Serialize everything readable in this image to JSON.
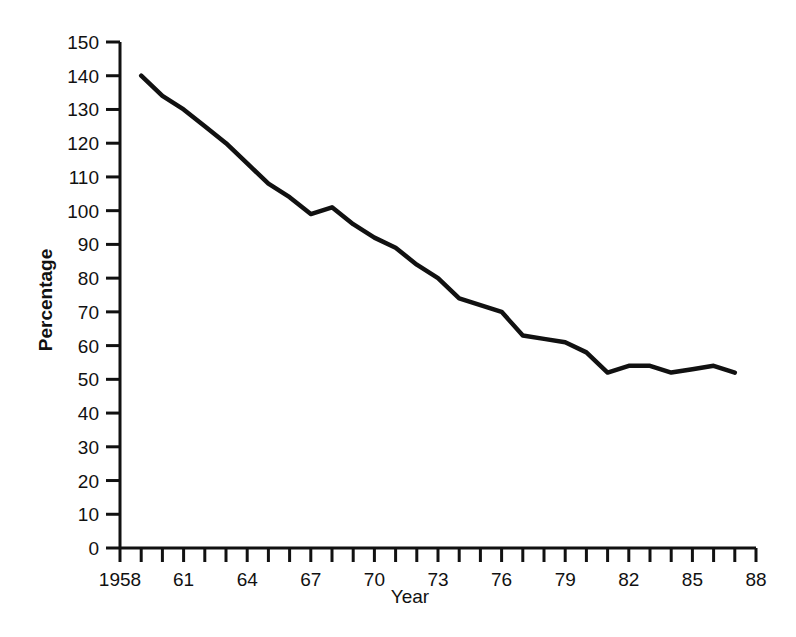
{
  "chart_data": {
    "type": "line",
    "title": "",
    "xlabel": "Year",
    "ylabel": "Percentage",
    "xlim": [
      1958,
      1988
    ],
    "ylim": [
      0,
      150
    ],
    "grid": false,
    "legend": null,
    "y_ticks": [
      0,
      10,
      20,
      30,
      40,
      50,
      60,
      70,
      80,
      90,
      100,
      110,
      120,
      130,
      140,
      150
    ],
    "y_tick_labels": [
      "0",
      "10",
      "20",
      "30",
      "40",
      "50",
      "60",
      "70",
      "80",
      "90",
      "100",
      "110",
      "120",
      "130",
      "140",
      "150"
    ],
    "x_ticks": [
      1958,
      1959,
      1960,
      1961,
      1962,
      1963,
      1964,
      1965,
      1966,
      1967,
      1968,
      1969,
      1970,
      1971,
      1972,
      1973,
      1974,
      1975,
      1976,
      1977,
      1978,
      1979,
      1980,
      1981,
      1982,
      1983,
      1984,
      1985,
      1986,
      1987,
      1988
    ],
    "x_tick_labels": [
      "1958",
      "",
      "",
      "61",
      "",
      "",
      "64",
      "",
      "",
      "67",
      "",
      "",
      "70",
      "",
      "",
      "73",
      "",
      "",
      "76",
      "",
      "",
      "79",
      "",
      "",
      "82",
      "",
      "",
      "85",
      "",
      "",
      "88"
    ],
    "x_labeled_ticks": [
      {
        "value": 1958,
        "label": "1958"
      },
      {
        "value": 1961,
        "label": "61"
      },
      {
        "value": 1964,
        "label": "64"
      },
      {
        "value": 1967,
        "label": "67"
      },
      {
        "value": 1970,
        "label": "70"
      },
      {
        "value": 1973,
        "label": "73"
      },
      {
        "value": 1976,
        "label": "76"
      },
      {
        "value": 1979,
        "label": "79"
      },
      {
        "value": 1982,
        "label": "82"
      },
      {
        "value": 1985,
        "label": "85"
      },
      {
        "value": 1988,
        "label": "88"
      }
    ],
    "series": [
      {
        "name": "Percentage",
        "color": "#111111",
        "x": [
          1959,
          1960,
          1961,
          1962,
          1963,
          1964,
          1965,
          1966,
          1967,
          1968,
          1969,
          1970,
          1971,
          1972,
          1973,
          1974,
          1975,
          1976,
          1977,
          1978,
          1979,
          1980,
          1981,
          1982,
          1983,
          1984,
          1985,
          1986,
          1987
        ],
        "values": [
          140,
          134,
          130,
          125,
          120,
          114,
          108,
          104,
          99,
          101,
          96,
          92,
          89,
          84,
          80,
          74,
          72,
          70,
          63,
          62,
          61,
          58,
          52,
          54,
          54,
          52,
          53,
          54,
          52
        ]
      }
    ]
  },
  "axes": {
    "y_title": "Percentage",
    "x_title": "Year"
  }
}
